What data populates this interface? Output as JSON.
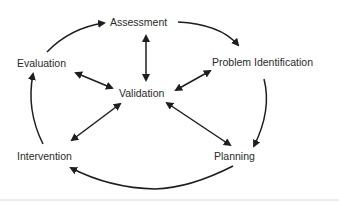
{
  "diagram": {
    "nodes": {
      "assessment": "Assessment",
      "problem_identification": "Problem Identification",
      "planning": "Planning",
      "intervention": "Intervention",
      "evaluation": "Evaluation",
      "validation": "Validation"
    },
    "cycle_order": [
      "Assessment",
      "Problem Identification",
      "Planning",
      "Intervention",
      "Evaluation"
    ],
    "center": "Validation",
    "colors": {
      "stroke": "#1e1e1e",
      "text": "#2a2a2a",
      "baseline": "#d8d8d8"
    }
  }
}
